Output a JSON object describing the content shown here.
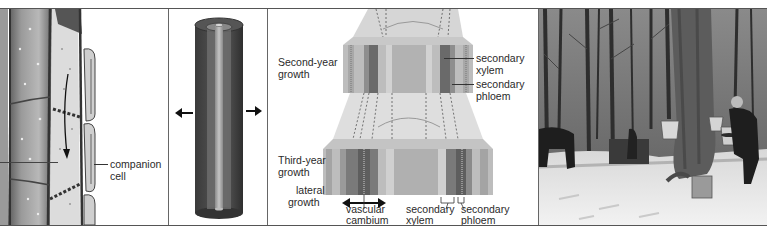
{
  "figure": {
    "panels": [
      {
        "id": "sieve-tube-panel",
        "type": "illustration",
        "labels": [
          "companion",
          "cell"
        ]
      },
      {
        "id": "cylinder-panel",
        "type": "illustration",
        "description": "stem cylinder with concentric layers and lateral arrows"
      },
      {
        "id": "secondary-growth-panel",
        "type": "illustration",
        "labels": {
          "second_year": [
            "Second-year",
            "growth"
          ],
          "third_year": [
            "Third-year",
            "growth"
          ],
          "lateral": [
            "lateral",
            "growth"
          ],
          "secondary_xylem_top": [
            "secondary",
            "xylem"
          ],
          "secondary_phloem_top": [
            "secondary",
            "phloem"
          ],
          "vascular_cambium": [
            "vascular",
            "cambium"
          ],
          "secondary_xylem_bottom": [
            "secondary",
            "xylem"
          ],
          "secondary_phloem_bottom": [
            "secondary",
            "phloem"
          ]
        }
      },
      {
        "id": "maple-sugaring-photo",
        "type": "photo",
        "description": "black-and-white photo of snowy maple forest with sap buckets on tree and worker"
      }
    ],
    "colors": {
      "border": "#555555",
      "xylem_dark": "#6a6a6a",
      "phloem_mid": "#8e8e8e",
      "tissue_light": "#c8c8c8",
      "pith": "#b4b4b4"
    }
  }
}
